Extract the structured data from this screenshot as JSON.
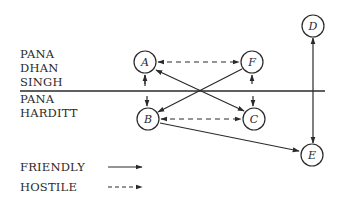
{
  "groups": {
    "upper": {
      "lines": [
        "PANA",
        "DHAN",
        "SINGH"
      ]
    },
    "lower": {
      "lines": [
        "PANA",
        "HARDITT"
      ]
    }
  },
  "nodes": {
    "A": {
      "label": "A",
      "x": 145,
      "y": 62
    },
    "F": {
      "label": "F",
      "x": 252,
      "y": 62
    },
    "B": {
      "label": "B",
      "x": 148,
      "y": 119
    },
    "C": {
      "label": "C",
      "x": 254,
      "y": 119
    },
    "D": {
      "label": "D",
      "x": 313,
      "y": 26
    },
    "E": {
      "label": "E",
      "x": 312,
      "y": 155
    }
  },
  "edges": [
    {
      "from": "A",
      "to": "F",
      "type": "hostile",
      "arrows": "both"
    },
    {
      "from": "B",
      "to": "C",
      "type": "hostile",
      "arrows": "both"
    },
    {
      "from": "A",
      "to": "B",
      "type": "friendly",
      "arrows": "both"
    },
    {
      "from": "F",
      "to": "C",
      "type": "friendly",
      "arrows": "both"
    },
    {
      "from": "A",
      "to": "C",
      "type": "friendly",
      "arrows": "both"
    },
    {
      "from": "F",
      "to": "B",
      "type": "friendly",
      "arrows": "to"
    },
    {
      "from": "B",
      "to": "E",
      "type": "friendly",
      "arrows": "to"
    },
    {
      "from": "D",
      "to": "E",
      "type": "friendly",
      "arrows": "both"
    }
  ],
  "legend": {
    "friendly": "FRIENDLY",
    "hostile": "HOSTILE"
  },
  "colors": {
    "ink": "#2a2a2a",
    "background": "#ffffff"
  }
}
